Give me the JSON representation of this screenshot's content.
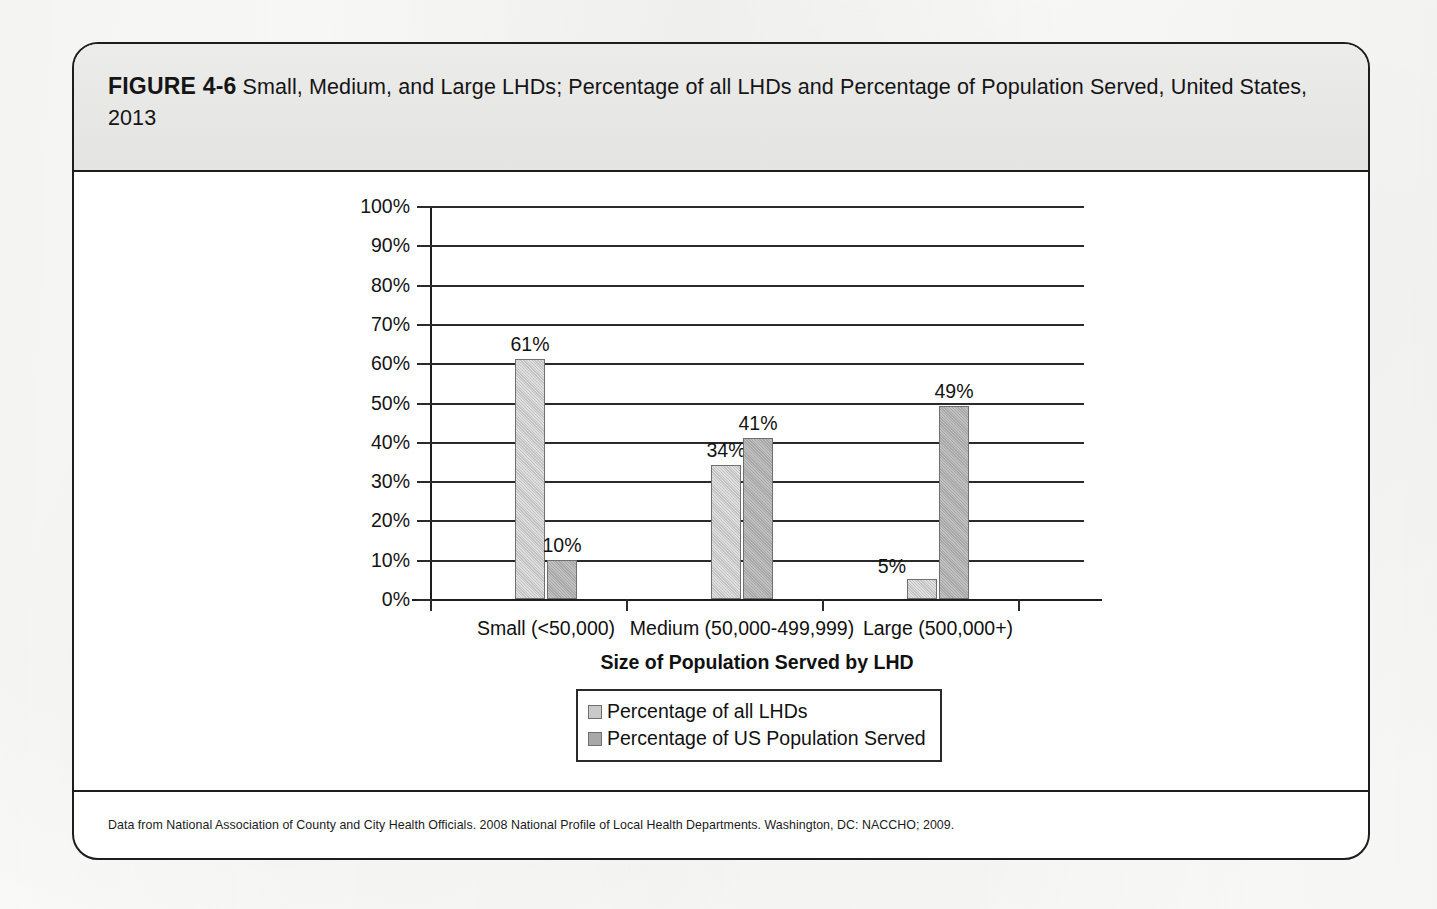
{
  "figure": {
    "label": "FIGURE 4-6",
    "title": "Small, Medium, and Large LHDs; Percentage of all LHDs and Percentage of Population Served, United States, 2013",
    "source": "Data from National Association of County and City Health Officials. 2008 National Profile of Local Health Departments. Washington, DC: NACCHO; 2009."
  },
  "chart_data": {
    "type": "bar",
    "title": "Small, Medium, and Large LHDs; Percentage of all LHDs and Percentage of Population Served, United States, 2013",
    "categories": [
      "Small (<50,000)",
      "Medium (50,000-499,999)",
      "Large (500,000+)"
    ],
    "series": [
      {
        "name": "Percentage of all LHDs",
        "values": [
          61,
          34,
          5
        ],
        "labels": [
          "61%",
          "34%",
          "5%"
        ],
        "color": "#c3c3c3"
      },
      {
        "name": "Percentage of US Population Served",
        "values": [
          10,
          41,
          49
        ],
        "labels": [
          "10%",
          "41%",
          "49%"
        ],
        "color": "#a8a8a8"
      }
    ],
    "xlabel": "Size of Population Served by LHD",
    "ylabel": "",
    "ylim": [
      0,
      100
    ],
    "ytick_values": [
      0,
      10,
      20,
      30,
      40,
      50,
      60,
      70,
      80,
      90,
      100
    ],
    "ytick_labels": [
      "0%",
      "10%",
      "20%",
      "30%",
      "40%",
      "50%",
      "60%",
      "70%",
      "80%",
      "90%",
      "100%"
    ],
    "grid": true,
    "legend_position": "bottom-center",
    "value_labels_shown": true
  }
}
